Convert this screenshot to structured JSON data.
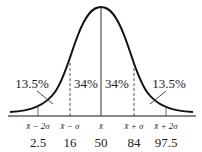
{
  "diagram": {
    "region_labels": {
      "left_tail": "13.5%",
      "left_center": "34%",
      "right_center": "34%",
      "right_tail": "13.5%"
    },
    "axis_symbols": [
      "x̄ − 2σ",
      "x̄ − σ",
      "x̄",
      "x̄ + σ",
      "x̄ + 2σ"
    ],
    "axis_values": [
      "2.5",
      "16",
      "50",
      "84",
      "97.5"
    ],
    "colors": {
      "curve": "#111111",
      "text": "#222222",
      "background": "#ffffff"
    }
  }
}
